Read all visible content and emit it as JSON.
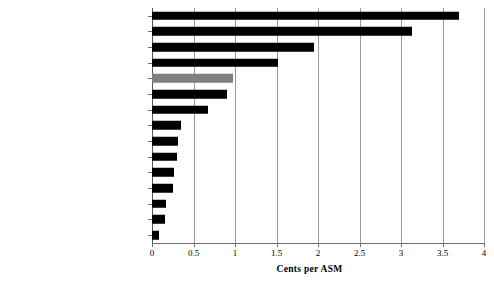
{
  "chart_data": {
    "type": "bar",
    "orientation": "horizontal",
    "title": "",
    "xlabel": "Cents per ASM",
    "ylabel": "",
    "xlim": [
      0,
      4
    ],
    "xticks": [
      "0",
      "0.5",
      "1",
      "1.5",
      "2",
      "2.5",
      "3",
      "3.5",
      "4"
    ],
    "xtick_values": [
      0,
      0.5,
      1,
      1.5,
      2,
      2.5,
      3,
      3.5,
      4
    ],
    "grid": "vertical",
    "legend": "none",
    "categories": [
      "FUEL",
      "LABOR",
      "TRANSPORT-RELATED EXPENSES",
      "OTHER OP. EXPENSES",
      "AVERAGE",
      "AIRCRAFT OWNERSHIP",
      "NON-AIRCRAFT  OWNERSHIP",
      "LANDING FEES",
      "MAINTENANCE METERIAL",
      "FOOD & BEVERAGE",
      "PAX. COMMISSIONS",
      "COMMUNICATION",
      "UTILITIES",
      "PROMOTION",
      "INSURANCE"
    ],
    "values": [
      3.7,
      3.13,
      1.95,
      1.52,
      0.98,
      0.9,
      0.68,
      0.35,
      0.31,
      0.3,
      0.27,
      0.25,
      0.17,
      0.16,
      0.09
    ],
    "bar_colors": [
      "#000000",
      "#000000",
      "#000000",
      "#000000",
      "#808080",
      "#000000",
      "#000000",
      "#000000",
      "#000000",
      "#000000",
      "#000000",
      "#000000",
      "#000000",
      "#000000",
      "#000000"
    ],
    "highlight_category": "AVERAGE",
    "highlight_color": "#808080",
    "default_bar_color": "#000000",
    "gridline_color": "#9a9a9a",
    "axis_color": "#6f6f6f"
  }
}
